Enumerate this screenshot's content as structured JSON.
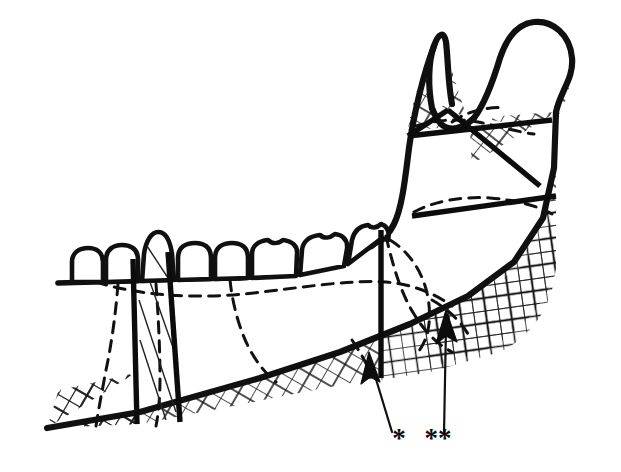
{
  "figure": {
    "background_color": "#ffffff",
    "line_color": "#101010",
    "width": 621,
    "height": 472
  },
  "markers": [
    {
      "id": "marker-single-asterisk",
      "label": "*",
      "label_x": 399,
      "label_y": 447,
      "leader": "oblique",
      "arrow_tip_x": 369,
      "arrow_tip_y": 355,
      "points_to": "lower border graft segment anterior to posterior vertical cut"
    },
    {
      "id": "marker-double-asterisk",
      "label": "**",
      "label_x": 430,
      "label_y": 447,
      "leader": "vertical",
      "arrow_tip_x": 446,
      "arrow_tip_y": 313,
      "points_to": "lower border graft segment posterior to vertical cut"
    }
  ],
  "osteotomy_cuts": {
    "vertical": [
      {
        "id": "cut-anterior-1",
        "label": "anterior vertical cut",
        "x_top": 133,
        "y_top": 260,
        "x_bottom": 137,
        "y_bottom": 424
      },
      {
        "id": "cut-anterior-2",
        "label": "second vertical cut",
        "x_top": 167,
        "y_top": 252,
        "x_bottom": 179,
        "y_bottom": 422
      },
      {
        "id": "cut-posterior",
        "label": "posterior vertical cut",
        "x_top": 381,
        "y_top": 228,
        "x_bottom": 381,
        "y_bottom": 377
      }
    ],
    "horizontal": [
      {
        "id": "cut-ramus-upper",
        "label": "upper ramus horizontal cut",
        "x1": 406,
        "y1": 134,
        "x2": 553,
        "y2": 121
      },
      {
        "id": "cut-ramus-lower",
        "label": "lower ramus horizontal cut",
        "x1": 412,
        "y1": 215,
        "x2": 556,
        "y2": 196
      }
    ]
  },
  "anatomy": {
    "coronoid_process": "coronoid process",
    "condylar_process": "condylar process",
    "sigmoid_notch": "mandibular notch",
    "ramus": "ramus of mandible",
    "angle": "angle of mandible",
    "body": "body of mandible",
    "alveolar_ridge": "alveolar ridge",
    "inferior_border": "inferior border"
  },
  "teeth": [
    {
      "id": "tooth-1",
      "name": "incisor"
    },
    {
      "id": "tooth-2",
      "name": "incisor"
    },
    {
      "id": "tooth-3",
      "name": "canine"
    },
    {
      "id": "tooth-4",
      "name": "premolar"
    },
    {
      "id": "tooth-5",
      "name": "premolar"
    },
    {
      "id": "tooth-6",
      "name": "first molar"
    },
    {
      "id": "tooth-7",
      "name": "second molar"
    },
    {
      "id": "tooth-8",
      "name": "third molar"
    }
  ],
  "hatched_regions": [
    {
      "id": "hatch-lower-border",
      "label": "lower border graft region",
      "pattern": "diagonal-crosshatch"
    },
    {
      "id": "hatch-angle",
      "label": "angle region",
      "pattern": "orthogonal-crosshatch"
    },
    {
      "id": "hatch-coronoid",
      "label": "coronoid region",
      "pattern": "diagonal-crosshatch"
    },
    {
      "id": "hatch-condyle",
      "label": "condylar region",
      "pattern": "diagonal-crosshatch"
    },
    {
      "id": "hatch-ramus-posterior",
      "label": "posterior ramus region",
      "pattern": "diagonal-crosshatch"
    }
  ]
}
